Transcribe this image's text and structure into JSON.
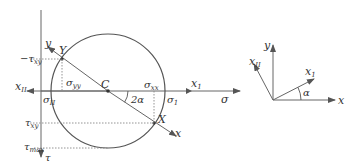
{
  "mohr_circle": {
    "axes": {
      "sigma_label": "σ",
      "tau_label": "τ",
      "x1_label": "x",
      "x1_sub": "1",
      "xII_label": "x",
      "xII_sub": "II"
    },
    "points": {
      "Y": "Y",
      "X": "X",
      "C": "C"
    },
    "rotated_axes": {
      "y_label": "y",
      "x_label": "x"
    },
    "annotations": {
      "neg_tau_xy": "−τ",
      "neg_tau_xy_sub": "xy",
      "tau_xy": "τ",
      "tau_xy_sub": "xy",
      "tau_max": "τ",
      "tau_max_sub": "max",
      "sigma_yy": "σ",
      "sigma_yy_sub": "yy",
      "sigma_xx": "σ",
      "sigma_xx_sub": "xx",
      "sigma_1": "σ",
      "sigma_1_sub": "1",
      "sigma_II": "σ",
      "sigma_II_sub": "II",
      "angle_2alpha": "2α"
    }
  },
  "coordinate_frame": {
    "y_label": "y",
    "x_label": "x",
    "x1_label": "x",
    "x1_sub": "1",
    "xII_label": "x",
    "xII_sub": "II",
    "angle_alpha": "α"
  },
  "colors": {
    "line": "#555555",
    "axis": "#666666",
    "dotted": "#888888"
  }
}
